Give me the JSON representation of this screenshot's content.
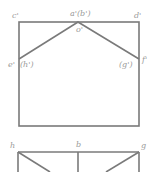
{
  "diagram": {
    "line_color": "#7a7a7a",
    "label_color": "#9a9a9a",
    "front_view": {
      "labels": {
        "c_prime": "c'",
        "a_prime_b_prime": "a'(b')",
        "d_prime": "d'",
        "o_prime": "o'",
        "e_prime": "e'",
        "h_prime": "(h')",
        "g_prime": "(g')",
        "f_prime": "f'"
      }
    },
    "top_view": {
      "labels": {
        "h": "h",
        "b": "b",
        "g": "g"
      }
    }
  }
}
